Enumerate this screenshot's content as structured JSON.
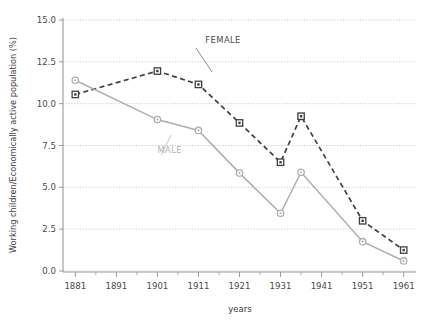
{
  "chart_data": {
    "type": "line",
    "title": "",
    "xlabel": "years",
    "ylabel": "Working children/Economically active population (%)",
    "x": [
      1881,
      1901,
      1911,
      1921,
      1931,
      1936,
      1951,
      1961
    ],
    "xlim": [
      1878,
      1964
    ],
    "ylim": [
      0.0,
      15.0
    ],
    "grid": true,
    "legend_position": "inline-annotation",
    "x_ticks": [
      "1881",
      "1891",
      "1901",
      "1911",
      "1921",
      "1931",
      "1941",
      "1951",
      "1961"
    ],
    "x_tick_values": [
      1881,
      1891,
      1901,
      1911,
      1921,
      1931,
      1941,
      1951,
      1961
    ],
    "x_minor_tick_values": [
      1886,
      1896,
      1906,
      1916,
      1926,
      1936,
      1946,
      1956
    ],
    "y_ticks": [
      "0.0",
      "2.5",
      "5.0",
      "7.5",
      "10.0",
      "12.5",
      "15.0"
    ],
    "y_tick_values": [
      0.0,
      2.5,
      5.0,
      7.5,
      10.0,
      12.5,
      15.0
    ],
    "series": [
      {
        "name": "FEMALE",
        "color": "#3f3f3f",
        "linestyle": "dashed",
        "marker": "square",
        "x": [
          1881,
          1901,
          1911,
          1921,
          1931,
          1936,
          1951,
          1961
        ],
        "values": [
          10.55,
          11.95,
          11.15,
          8.85,
          6.5,
          9.25,
          3.0,
          1.25
        ]
      },
      {
        "name": "MALE",
        "color": "#aeaeae",
        "linestyle": "solid",
        "marker": "circle",
        "x": [
          1881,
          1901,
          1911,
          1921,
          1931,
          1936,
          1951,
          1961
        ],
        "values": [
          11.4,
          9.05,
          8.4,
          5.85,
          3.45,
          5.9,
          1.75,
          0.6
        ]
      }
    ],
    "annotations": [
      {
        "text": "FEMALE",
        "color": "#4a4a4a",
        "x": 1917,
        "y": 13.6
      },
      {
        "text": "MALE",
        "color": "#b3b3b3",
        "x": 1904,
        "y": 7.05
      }
    ]
  },
  "axis": {
    "x_title": "years",
    "y_title": "Working children/Economically active population (%)"
  },
  "colors": {
    "female_line": "#3f3f3f",
    "male_line": "#aeaeae",
    "grid": "#bfbfbf",
    "axis": "#9a9a9a",
    "tick_text": "#4a4a4a"
  }
}
